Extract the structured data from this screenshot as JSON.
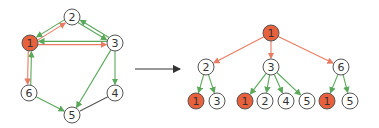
{
  "colors": {
    "highlight_node": "#e8603c",
    "red_edge": "#ea7b62",
    "green_edge": "#5aa85a",
    "plain_edge": "#555555",
    "node_fill": "#ffffff",
    "node_stroke": "#555555"
  },
  "graph": {
    "nodes": [
      {
        "id": "1",
        "label": "1",
        "x": 30,
        "y": 43,
        "highlight": true
      },
      {
        "id": "2",
        "label": "2",
        "x": 72,
        "y": 17,
        "highlight": false
      },
      {
        "id": "3",
        "label": "3",
        "x": 115,
        "y": 43,
        "highlight": false
      },
      {
        "id": "4",
        "label": "4",
        "x": 115,
        "y": 93,
        "highlight": false
      },
      {
        "id": "5",
        "label": "5",
        "x": 72,
        "y": 115,
        "highlight": false
      },
      {
        "id": "6",
        "label": "6",
        "x": 29,
        "y": 93,
        "highlight": false
      }
    ],
    "edges": [
      {
        "from": "1",
        "to": "2",
        "type": "red"
      },
      {
        "from": "2",
        "to": "1",
        "type": "green"
      },
      {
        "from": "1",
        "to": "3",
        "type": "red"
      },
      {
        "from": "3",
        "to": "1",
        "type": "green"
      },
      {
        "from": "2",
        "to": "3",
        "type": "green"
      },
      {
        "from": "3",
        "to": "2",
        "type": "green"
      },
      {
        "from": "3",
        "to": "4",
        "type": "green"
      },
      {
        "from": "3",
        "to": "5",
        "type": "green"
      },
      {
        "from": "1",
        "to": "6",
        "type": "red"
      },
      {
        "from": "6",
        "to": "1",
        "type": "green"
      },
      {
        "from": "6",
        "to": "5",
        "type": "green"
      },
      {
        "from": "4",
        "to": "5",
        "type": "plain"
      }
    ]
  },
  "arrow": {
    "x1": 135,
    "y1": 69,
    "x2": 180,
    "y2": 69
  },
  "tree": {
    "nodes": [
      {
        "label": "1",
        "x": 271,
        "y": 33,
        "highlight": true
      },
      {
        "label": "2",
        "x": 206,
        "y": 67,
        "highlight": false
      },
      {
        "label": "3",
        "x": 271,
        "y": 67,
        "highlight": false
      },
      {
        "label": "6",
        "x": 341,
        "y": 67,
        "highlight": false
      },
      {
        "label": "1",
        "x": 196,
        "y": 101,
        "highlight": true
      },
      {
        "label": "3",
        "x": 217,
        "y": 101,
        "highlight": false
      },
      {
        "label": "1",
        "x": 245,
        "y": 101,
        "highlight": true
      },
      {
        "label": "2",
        "x": 265,
        "y": 101,
        "highlight": false
      },
      {
        "label": "4",
        "x": 286,
        "y": 101,
        "highlight": false
      },
      {
        "label": "5",
        "x": 307,
        "y": 101,
        "highlight": false
      },
      {
        "label": "1",
        "x": 327,
        "y": 101,
        "highlight": true
      },
      {
        "label": "5",
        "x": 350,
        "y": 101,
        "highlight": false
      }
    ],
    "edges": [
      {
        "from": 0,
        "to": 1,
        "type": "red"
      },
      {
        "from": 0,
        "to": 2,
        "type": "red"
      },
      {
        "from": 0,
        "to": 3,
        "type": "red"
      },
      {
        "from": 1,
        "to": 4,
        "type": "green"
      },
      {
        "from": 1,
        "to": 5,
        "type": "green"
      },
      {
        "from": 2,
        "to": 6,
        "type": "green"
      },
      {
        "from": 2,
        "to": 7,
        "type": "green"
      },
      {
        "from": 2,
        "to": 8,
        "type": "green"
      },
      {
        "from": 2,
        "to": 9,
        "type": "green"
      },
      {
        "from": 3,
        "to": 10,
        "type": "green"
      },
      {
        "from": 3,
        "to": 11,
        "type": "green"
      }
    ]
  }
}
